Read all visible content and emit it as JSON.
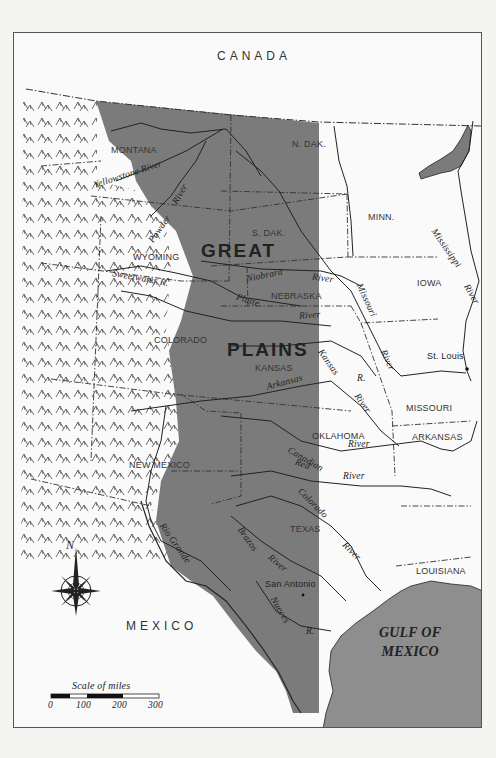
{
  "map": {
    "countries": {
      "north": "CANADA",
      "south": "MEXICO"
    },
    "region": {
      "line1": "GREAT",
      "line2": "PLAINS",
      "fill_color": "#7b7b7b"
    },
    "mountains": {
      "label": "ROCKY MOUNTAINS"
    },
    "states": [
      "MONTANA",
      "N. DAK.",
      "S. DAK.",
      "WYOMING",
      "NEBRASKA",
      "COLORADO",
      "KANSAS",
      "NEW MEXICO",
      "OKLAHOMA",
      "TEXAS",
      "MINN.",
      "IOWA",
      "MISSOURI",
      "ARKANSAS",
      "LOUISIANA"
    ],
    "rivers": {
      "yellowstone": "Yellowstone River",
      "powder_1": "Powder",
      "powder_2": "River",
      "sweetwater": "Sweetwater R.",
      "niobrara": "Niobrara",
      "niobrara_river": "River",
      "platte": "Platte",
      "platte_river": "River",
      "missouri": "Missouri",
      "missouri_river": "River",
      "mississippi": "Mississippi",
      "mississippi_river": "River",
      "kansas": "Kansas",
      "kansas_r": "R.",
      "arkansas": "Arkansas",
      "arkansas_river": "River",
      "canadian": "Canadian",
      "canadian_river": "River",
      "red": "Red",
      "red_river": "River",
      "colorado": "Colorado",
      "colorado_river": "River",
      "brazos": "Brazos",
      "brazos_river": "River",
      "nueces": "Nueces",
      "nueces_r": "R.",
      "rio_grande": "Rio Grande"
    },
    "cities": {
      "st_louis": "St. Louis",
      "san_antonio": "San Antonio"
    },
    "water": {
      "gulf_line1": "GULF OF",
      "gulf_line2": "MEXICO",
      "water_color": "#8e8e8e"
    },
    "compass": {
      "north_label": "N"
    },
    "scale": {
      "title": "Scale of miles",
      "ticks": [
        "0",
        "100",
        "200",
        "300"
      ]
    }
  }
}
